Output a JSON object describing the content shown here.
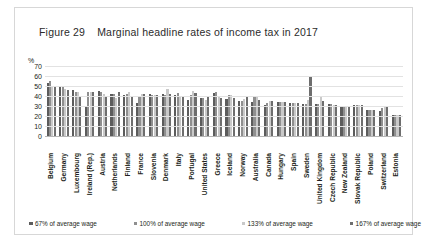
{
  "figure": {
    "number_label": "Figure 29",
    "title": "Marginal headline rates of income tax in 2017"
  },
  "chart_data": {
    "type": "bar",
    "title": "Marginal headline rates of income tax in 2017",
    "xlabel": "",
    "ylabel": "%",
    "y_unit_label": "%",
    "ylim": [
      0,
      70
    ],
    "yticks": [
      70,
      60,
      50,
      40,
      30,
      20,
      10,
      0
    ],
    "grid": true,
    "legend_position": "bottom",
    "categories": [
      "Belgium",
      "Germany",
      "Luxembourg",
      "Ireland (Rep.)",
      "Austria",
      "Netherlands",
      "Finland",
      "France",
      "Slovenia",
      "Denmark",
      "Italy",
      "Portugal",
      "United States",
      "Greece",
      "Iceland",
      "Norway",
      "Australia",
      "Canada",
      "Hungary",
      "Spain",
      "Sweden",
      "United Kingdom",
      "Czech Republic",
      "New Zealand",
      "Slovak Republic",
      "Poland",
      "Switzerland",
      "Estonia"
    ],
    "series": [
      {
        "name": "67% of average wage",
        "color": "#5c5c5c",
        "values": [
          53,
          49,
          46,
          30,
          45,
          42,
          41,
          33,
          42,
          42,
          41,
          36,
          38,
          43,
          37,
          35,
          34,
          31,
          34,
          33,
          32,
          32,
          32,
          30,
          31,
          26,
          25,
          21
        ]
      },
      {
        "name": "100% of average wage",
        "color": "#8f8f8f",
        "values": [
          55,
          50,
          44,
          44,
          44,
          42,
          42,
          40,
          41,
          41,
          43,
          41,
          38,
          44,
          41,
          35,
          39,
          33,
          34,
          33,
          32,
          32,
          32,
          30,
          31,
          26,
          28,
          21
        ]
      },
      {
        "name": "133% of average wage",
        "color": "#c9c9c9",
        "values": [
          50,
          47,
          44,
          44,
          42,
          38,
          44,
          42,
          41,
          47,
          40,
          45,
          36,
          40,
          41,
          37,
          39,
          35,
          34,
          33,
          36,
          39,
          31,
          30,
          31,
          26,
          29,
          21
        ]
      },
      {
        "name": "167% of average wage",
        "color": "#6e6e6e",
        "values": [
          50,
          46,
          40,
          44,
          40,
          44,
          40,
          42,
          41,
          42,
          40,
          43,
          40,
          38,
          38,
          39,
          36,
          35,
          34,
          33,
          60,
          35,
          31,
          30,
          31,
          26,
          29,
          21
        ]
      }
    ]
  },
  "legend": {
    "items": [
      {
        "label": "67% of average wage",
        "swatch": "s0"
      },
      {
        "label": "100% of average wage",
        "swatch": "s1"
      },
      {
        "label": "133% of average wage",
        "swatch": "s2"
      },
      {
        "label": "167% of average wage",
        "swatch": "s3"
      }
    ]
  }
}
